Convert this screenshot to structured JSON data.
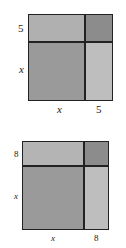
{
  "diagrams": [
    {
      "id": "top",
      "side_label_top": "5",
      "side_label_bottom": "x",
      "bottom_label_left": "x",
      "bottom_label_right": "5",
      "colors": {
        "top_left": "#b0b0b0",
        "top_right": "#8c8c8c",
        "bottom_left": "#9a9a9a",
        "bottom_right": "#bebebe"
      }
    },
    {
      "id": "bottom",
      "side_label_top": "8",
      "side_label_bottom": "x",
      "bottom_label_left": "x",
      "bottom_label_right": "8",
      "colors": {
        "top_left": "#b4b4b4",
        "top_right": "#8c8c8c",
        "bottom_left": "#9a9a9a",
        "bottom_right": "#bebebe"
      }
    }
  ]
}
